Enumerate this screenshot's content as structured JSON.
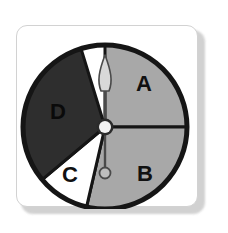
{
  "card": {
    "background": "#ffffff",
    "border_color": "#d2d2d2",
    "shadow_color": "#c9c9c9"
  },
  "spinner": {
    "name": "spinner-wheel",
    "outline_color": "#151515",
    "center": {
      "x": 105,
      "y": 127
    },
    "radius": 82,
    "hub": {
      "fill": "#f2f2f2",
      "ring": "#2b2b2b",
      "radius": 6
    },
    "needle": {
      "name": "spinner-needle",
      "pointing_at": "A",
      "angle_degrees": 0,
      "shaft_color": "#9a9a9a",
      "outline_color": "#4a4a4a",
      "tip_fill": "#d8d8d8",
      "counterweight_fill": "#bdbdbd"
    },
    "sectors": [
      {
        "label": "A",
        "fill": "#a8a8a8",
        "text_color": "#111111",
        "start_angle": -90,
        "end_angle": 0,
        "label_x": 144,
        "label_y": 85
      },
      {
        "label": "B",
        "fill": "#a8a8a8",
        "text_color": "#111111",
        "start_angle": 0,
        "end_angle": 103,
        "label_x": 145,
        "label_y": 175
      },
      {
        "label": "C",
        "fill": "#ffffff",
        "text_color": "#111111",
        "start_angle": 103,
        "end_angle": 140,
        "label_x": 70,
        "label_y": 176
      },
      {
        "label": "D",
        "fill": "#2e2e2e",
        "text_color": "#0a0a0a",
        "start_angle": 140,
        "end_angle": 253,
        "label_x": 58,
        "label_y": 113
      }
    ]
  },
  "chart_data": {
    "type": "pie",
    "title": "",
    "categories": [
      "A",
      "B",
      "C",
      "D"
    ],
    "values": [
      90,
      103,
      37,
      130
    ],
    "value_units": "degrees",
    "fractions": [
      0.25,
      0.286,
      0.103,
      0.361
    ],
    "colors": [
      "#a8a8a8",
      "#a8a8a8",
      "#ffffff",
      "#2e2e2e"
    ],
    "start_angles": [
      -90,
      0,
      103,
      140
    ],
    "end_angles": [
      0,
      103,
      140,
      253
    ],
    "legend": "none",
    "grid": false,
    "annotations": [
      "needle points to A"
    ]
  }
}
